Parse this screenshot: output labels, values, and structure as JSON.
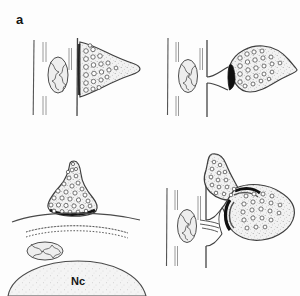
{
  "figure": {
    "background_color": "#fdfdfd",
    "ink_color": "#3a3a3a",
    "fill_color": "#efefef",
    "width": 300,
    "height": 296,
    "panel_count": 4
  },
  "panels": [
    {
      "id": "a",
      "label": "a",
      "caption": "Axodendritic synapse on dendritic shaft",
      "elements": [
        {
          "name": "dendrite-membrane-line",
          "kind": "vertical-line",
          "count": 2
        },
        {
          "name": "microtubule",
          "kind": "double-vertical-line",
          "count": 3
        },
        {
          "name": "mitochondrion",
          "kind": "ellipse-with-cristae",
          "count": 1
        },
        {
          "name": "presynaptic-terminal",
          "kind": "cone-bouton",
          "count": 1
        },
        {
          "name": "synaptic-vesicle",
          "kind": "small-circle",
          "count": 22
        },
        {
          "name": "postsynaptic-density",
          "kind": "dark-band",
          "count": 1
        }
      ]
    },
    {
      "id": "b",
      "label": "b",
      "caption": "Axospinous synapse on dendritic spine",
      "elements": [
        {
          "name": "dendrite-membrane-line",
          "kind": "vertical-line",
          "count": 2
        },
        {
          "name": "microtubule",
          "kind": "double-vertical-line",
          "count": 3
        },
        {
          "name": "mitochondrion",
          "kind": "ellipse-with-cristae",
          "count": 1
        },
        {
          "name": "spine-neck",
          "kind": "narrow-stalk",
          "count": 1
        },
        {
          "name": "presynaptic-terminal",
          "kind": "bulb-bouton",
          "count": 1
        },
        {
          "name": "synaptic-vesicle",
          "kind": "small-circle",
          "count": 24
        },
        {
          "name": "postsynaptic-density",
          "kind": "dark-lens-band",
          "count": 1
        }
      ]
    },
    {
      "id": "c",
      "label": "c",
      "caption": "Axosomatic synapse with subsurface cisterna",
      "soma_label": "Nc",
      "elements": [
        {
          "name": "presynaptic-terminal",
          "kind": "flask-bouton",
          "count": 1
        },
        {
          "name": "synaptic-vesicle",
          "kind": "small-circle",
          "count": 30
        },
        {
          "name": "postsynaptic-density",
          "kind": "dark-band",
          "count": 1
        },
        {
          "name": "soma-membrane",
          "kind": "curved-line",
          "count": 1
        },
        {
          "name": "subsurface-cisterna",
          "kind": "dotted-double-curve",
          "count": 1
        },
        {
          "name": "mitochondrion",
          "kind": "ellipse-with-cristae",
          "count": 1
        },
        {
          "name": "nucleus",
          "kind": "large-dome",
          "count": 1
        }
      ]
    },
    {
      "id": "d",
      "label": "d",
      "caption": "Complex glomerular synaptic arrangement",
      "elements": [
        {
          "name": "dendrite-membrane-line",
          "kind": "vertical-line",
          "count": 2
        },
        {
          "name": "microtubule",
          "kind": "double-vertical-line",
          "count": 3
        },
        {
          "name": "mitochondrion",
          "kind": "ellipse-with-cristae",
          "count": 1
        },
        {
          "name": "presynaptic-terminal",
          "kind": "cone-bouton",
          "count": 1
        },
        {
          "name": "postsynaptic-profile",
          "kind": "lobed-bouton",
          "count": 1
        },
        {
          "name": "synaptic-vesicle",
          "kind": "small-circle",
          "count": 34
        },
        {
          "name": "postsynaptic-density",
          "kind": "dark-band",
          "count": 2
        },
        {
          "name": "spine-apparatus",
          "kind": "stacked-lamellae",
          "count": 1
        }
      ]
    }
  ]
}
